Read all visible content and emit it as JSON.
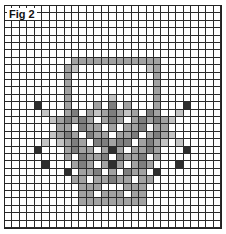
{
  "figure": {
    "label": "Fig 2",
    "columns": 29,
    "rows": 30,
    "palette": {
      ".": "#ffffff",
      "l": "#c4c4c4",
      "m": "#a2a2a2",
      "d": "#7e7e7e",
      "k": "#2e2e2e"
    },
    "pattern": [
      ".............................",
      ".............................",
      ".............................",
      ".............................",
      ".............................",
      ".............................",
      ".............................",
      ".........mmmmmmmmmmmm........",
      "........ml.........lm........",
      "........m...........m........",
      "........m...........m........",
      "........m...........m........",
      "........m.....l.....m........",
      "....k...m...m.d.m...m...k....",
      ".....l..md.mlmdmlm.dm..l.....",
      "......lmdmdm.mdm.mdmdml......",
      ".......mm.dmm.m.mmd.mm.......",
      "......lmdm.dmm.mmd.mdml......",
      ".....l.lmdm.ddmdd.mdml.l.....",
      "....k...mdmm.mkm.mmdm...k....",
      "........m.dmmd.dmmd.m........",
      ".....k...mdm.mkm.mdm...k.....",
      "........k.mmd.m.dmm.k........",
      ".........mm.mmdmm.mm.........",
      "..........mmm...mmm..........",
      "..........mm.mmm.mm..........",
      "..........mmmmmmmmm..........",
      ".............................",
      ".............................",
      "............................."
    ]
  }
}
